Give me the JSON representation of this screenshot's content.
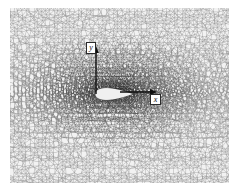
{
  "figure": {
    "kind": "unstructured-triangular-mesh",
    "background_color": "#ffffff",
    "plot_area": {
      "left": 10,
      "top": 8,
      "width": 219,
      "height": 175,
      "base_color": "#f2f2f2",
      "line_color": "#1a1a1a"
    }
  },
  "axes": {
    "origin": {
      "x": 96,
      "y": 92
    },
    "line_color": "#101010",
    "y_axis": {
      "label": "y",
      "direction": "up",
      "tip": {
        "x": 96,
        "y": 47
      },
      "base": {
        "x": 96,
        "y": 94
      },
      "label_box": {
        "x": 86,
        "y": 42,
        "w": 10,
        "h": 12
      }
    },
    "x_axis": {
      "label": "x",
      "direction": "right",
      "tip": {
        "x": 157,
        "y": 92
      },
      "base": {
        "x": 120,
        "y": 92
      },
      "label_box": {
        "x": 150,
        "y": 94,
        "w": 11,
        "h": 11
      }
    }
  },
  "airfoil": {
    "label": "airfoil-body",
    "fill_color": "#f0f0f0",
    "outline_color": "#2a2a2a",
    "chord_start_x": 95,
    "chord_end_x": 133,
    "center_y": 94,
    "max_thickness": 4
  },
  "mesh_density": {
    "note": "Triangular cells refine radially toward the airfoil",
    "coarse_cell_px": 4.0,
    "fine_cell_px": 0.55,
    "refinement_center": {
      "x": 114,
      "y": 92
    },
    "wake_bias_x": 1.6,
    "darkest_color": "#080808",
    "lightest_color": "#f6f6f6"
  }
}
